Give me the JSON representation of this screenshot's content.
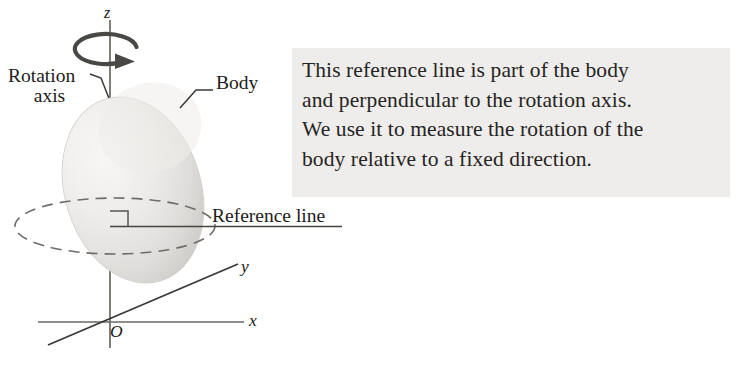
{
  "figure": {
    "background_color": "#ffffff",
    "callout": {
      "background_color": "#eeedeb",
      "text_color": "#262422",
      "lines": [
        "This reference line is part of the body",
        "and perpendicular to the rotation axis.",
        "We use it to measure the rotation of the",
        "body relative to a fixed direction."
      ],
      "full_text": "This reference line is part of the body and perpendicular to the rotation axis. We use it to measure the rotation of the body relative to a fixed direction."
    },
    "labels": {
      "rotation_axis_line1": "Rotation",
      "rotation_axis_line2": "axis",
      "body": "Body",
      "reference_line": "Reference line",
      "axis_z": "z",
      "axis_x": "x",
      "axis_y": "y",
      "origin": "O"
    },
    "colors": {
      "line": "#3b3936",
      "axis": "#5b5955",
      "dashed_ellipse": "#6e6c68",
      "body_fill_light": "#f4f3f2",
      "body_fill_mid": "#e0dfdd",
      "body_fill_dark": "#c9c7c4",
      "text": "#1d1b19"
    },
    "elements": {
      "body_shape": "tilted-ellipsoid",
      "rotation_arrow": "circular-arrow-around-z-axis",
      "equator": "dashed-ellipse",
      "right_angle_marker": "square",
      "reference_line": "horizontal-solid-line"
    }
  }
}
